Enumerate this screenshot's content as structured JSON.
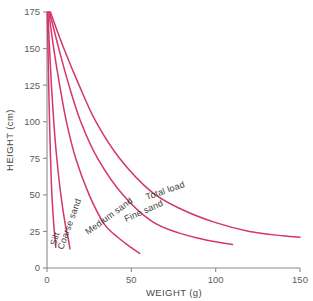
{
  "chart_data": {
    "type": "line",
    "title": "",
    "xlabel": "WEIGHT (g)",
    "ylabel": "HEIGHT (cm)",
    "xlim": [
      0,
      150
    ],
    "ylim": [
      0,
      175
    ],
    "xticks": [
      0,
      50,
      100,
      150
    ],
    "yticks": [
      0,
      25,
      50,
      75,
      100,
      125,
      150,
      175
    ],
    "grid": false,
    "legend": "inline-curve-labels",
    "series_color": "#d6356a",
    "series": [
      {
        "name": "Silt",
        "label": "Silt",
        "points": [
          [
            0.2,
            175
          ],
          [
            0.6,
            150
          ],
          [
            1.0,
            125
          ],
          [
            1.5,
            100
          ],
          [
            2.1,
            75
          ],
          [
            2.9,
            50
          ],
          [
            4.0,
            30
          ],
          [
            4.8,
            20
          ],
          [
            5.2,
            14
          ]
        ]
      },
      {
        "name": "Coarse sand",
        "label": "Coarse sand",
        "points": [
          [
            0.5,
            175
          ],
          [
            1.5,
            150
          ],
          [
            2.6,
            125
          ],
          [
            4.0,
            100
          ],
          [
            5.8,
            75
          ],
          [
            8.2,
            50
          ],
          [
            10.8,
            30
          ],
          [
            12.6,
            20
          ],
          [
            13.6,
            13
          ]
        ]
      },
      {
        "name": "Medium sand",
        "label": "Medium sand",
        "points": [
          [
            1.0,
            175
          ],
          [
            4.0,
            150
          ],
          [
            7.5,
            125
          ],
          [
            11.5,
            100
          ],
          [
            17.0,
            75
          ],
          [
            25.0,
            50
          ],
          [
            34.0,
            30
          ],
          [
            43.0,
            20
          ],
          [
            50.0,
            14
          ],
          [
            55.0,
            10
          ]
        ]
      },
      {
        "name": "Fine sand",
        "label": "Fine sand",
        "points": [
          [
            1.5,
            175
          ],
          [
            7.0,
            150
          ],
          [
            13.0,
            125
          ],
          [
            20.0,
            100
          ],
          [
            30.0,
            75
          ],
          [
            45.0,
            50
          ],
          [
            62.0,
            32
          ],
          [
            78.0,
            24
          ],
          [
            95.0,
            19
          ],
          [
            110.0,
            16
          ]
        ]
      },
      {
        "name": "Total load",
        "label": "Total load",
        "points": [
          [
            2.0,
            175
          ],
          [
            10.0,
            150
          ],
          [
            19.0,
            125
          ],
          [
            29.0,
            100
          ],
          [
            43.0,
            75
          ],
          [
            62.0,
            52
          ],
          [
            80.0,
            40
          ],
          [
            100.0,
            31
          ],
          [
            120.0,
            25
          ],
          [
            140.0,
            22
          ],
          [
            150.0,
            21
          ]
        ]
      }
    ],
    "curve_labels": [
      {
        "text": "Silt",
        "x": 56,
        "y": 246,
        "rotate": -74
      },
      {
        "text": "Coarse sand",
        "x": 63,
        "y": 250,
        "rotate": -70
      },
      {
        "text": "Medium sand",
        "x": 88,
        "y": 235,
        "rotate": -36
      },
      {
        "text": "Fine sand",
        "x": 126,
        "y": 222,
        "rotate": -24
      },
      {
        "text": "Total load",
        "x": 147,
        "y": 200,
        "rotate": -19
      }
    ]
  }
}
